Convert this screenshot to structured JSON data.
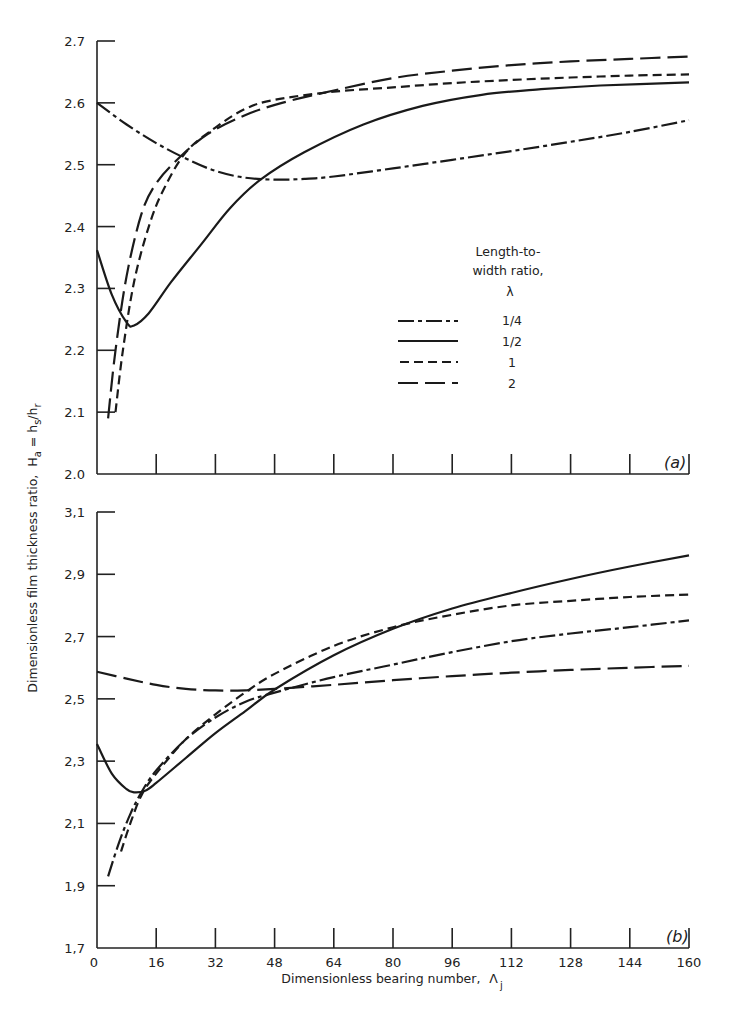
{
  "chart_data": [
    {
      "type": "line",
      "panel_label": "(a)",
      "xlabel": "Dimensionless bearing number, Λ_j",
      "ylabel": "Dimensionless film thickness ratio, H_a = h_s/h_r",
      "xlim": [
        0,
        160
      ],
      "ylim": [
        2.0,
        2.7
      ],
      "x_ticks": [
        0,
        16,
        32,
        48,
        64,
        80,
        96,
        112,
        128,
        144,
        160
      ],
      "y_ticks": [
        "2.0",
        "2.1",
        "2.2",
        "2.3",
        "2.4",
        "2.5",
        "2.6",
        "2.7"
      ],
      "grid": false,
      "legend": {
        "title": [
          "Length-to-",
          "width ratio,",
          "λ"
        ],
        "position": "center-right"
      },
      "series": [
        {
          "name": "1/4",
          "style": "dash-dot",
          "x": [
            0,
            8,
            16,
            24,
            32,
            40,
            48,
            56,
            64,
            80,
            96,
            112,
            128,
            144,
            160
          ],
          "y": [
            2.6,
            2.565,
            2.535,
            2.51,
            2.49,
            2.479,
            2.476,
            2.477,
            2.481,
            2.494,
            2.508,
            2.522,
            2.537,
            2.553,
            2.572
          ]
        },
        {
          "name": "1/2",
          "style": "solid",
          "x": [
            0,
            4,
            8,
            10,
            14,
            20,
            28,
            36,
            44,
            56,
            72,
            88,
            104,
            120,
            136,
            160
          ],
          "y": [
            2.362,
            2.29,
            2.245,
            2.24,
            2.26,
            2.31,
            2.37,
            2.43,
            2.475,
            2.52,
            2.565,
            2.595,
            2.613,
            2.622,
            2.628,
            2.633
          ]
        },
        {
          "name": "1",
          "style": "short-dash",
          "x": [
            5,
            7,
            10,
            14,
            18,
            24,
            32,
            40,
            48,
            64,
            80,
            96,
            112,
            128,
            144,
            160
          ],
          "y": [
            2.1,
            2.2,
            2.31,
            2.4,
            2.46,
            2.52,
            2.56,
            2.59,
            2.605,
            2.618,
            2.625,
            2.632,
            2.637,
            2.641,
            2.644,
            2.646
          ]
        },
        {
          "name": "2",
          "style": "long-dash",
          "x": [
            3,
            5,
            8,
            12,
            16,
            22,
            30,
            40,
            50,
            64,
            80,
            96,
            112,
            128,
            144,
            160
          ],
          "y": [
            2.09,
            2.2,
            2.32,
            2.42,
            2.47,
            2.51,
            2.55,
            2.58,
            2.6,
            2.62,
            2.64,
            2.652,
            2.661,
            2.667,
            2.671,
            2.675
          ]
        }
      ]
    },
    {
      "type": "line",
      "panel_label": "(b)",
      "xlabel": "Dimensionless bearing number, Λ_j",
      "ylabel": "Dimensionless film thickness ratio, H_a = h_s/h_r",
      "xlim": [
        0,
        160
      ],
      "ylim": [
        1.7,
        3.1
      ],
      "x_ticks": [
        0,
        16,
        32,
        48,
        64,
        80,
        96,
        112,
        128,
        144,
        160
      ],
      "y_ticks": [
        "1.7",
        "1.9",
        "2.1",
        "2.3",
        "2.5",
        "2.7",
        "2.9",
        "3.1"
      ],
      "grid": false,
      "series": [
        {
          "name": "1/4",
          "style": "dash-dot",
          "x": [
            3,
            6,
            9,
            12,
            16,
            24,
            32,
            40,
            48,
            64,
            80,
            96,
            112,
            128,
            144,
            160
          ],
          "y": [
            1.93,
            2.04,
            2.13,
            2.2,
            2.27,
            2.37,
            2.44,
            2.49,
            2.52,
            2.57,
            2.61,
            2.65,
            2.685,
            2.71,
            2.73,
            2.752
          ]
        },
        {
          "name": "1/2",
          "style": "solid",
          "x": [
            0,
            4,
            8,
            10,
            13,
            16,
            24,
            32,
            40,
            48,
            64,
            80,
            96,
            112,
            128,
            144,
            160
          ],
          "y": [
            2.355,
            2.26,
            2.21,
            2.2,
            2.205,
            2.23,
            2.31,
            2.39,
            2.46,
            2.53,
            2.64,
            2.725,
            2.79,
            2.84,
            2.885,
            2.925,
            2.961
          ]
        },
        {
          "name": "1",
          "style": "short-dash",
          "x": [
            6.5,
            9,
            12,
            16,
            24,
            32,
            40,
            48,
            64,
            80,
            96,
            112,
            128,
            144,
            160
          ],
          "y": [
            2.01,
            2.1,
            2.19,
            2.26,
            2.37,
            2.45,
            2.52,
            2.58,
            2.67,
            2.73,
            2.77,
            2.8,
            2.815,
            2.827,
            2.835
          ]
        },
        {
          "name": "2",
          "style": "long-dash",
          "x": [
            0,
            8,
            16,
            24,
            32,
            40,
            48,
            64,
            80,
            96,
            112,
            128,
            144,
            160
          ],
          "y": [
            2.587,
            2.565,
            2.545,
            2.532,
            2.527,
            2.527,
            2.532,
            2.545,
            2.56,
            2.573,
            2.584,
            2.593,
            2.6,
            2.606
          ]
        }
      ]
    }
  ],
  "axes": {
    "xlabel_main": "Dimensionless bearing number,",
    "xlabel_symbol": "Λ",
    "xlabel_sub": "j",
    "ylabel_main": "Dimensionless film thickness ratio,",
    "ylabel_symbol": "H",
    "ylabel_sub_a": "a",
    "ylabel_eq": " = h",
    "ylabel_sub_s": "s",
    "ylabel_slash": "/h",
    "ylabel_sub_r": "r"
  },
  "legend": {
    "title_line1": "Length-to-",
    "title_line2": "width ratio,",
    "title_line3": "λ",
    "entries": [
      "1/4",
      "1/2",
      "1",
      "2"
    ]
  },
  "panel_labels": {
    "a": "(a)",
    "b": "(b)"
  }
}
